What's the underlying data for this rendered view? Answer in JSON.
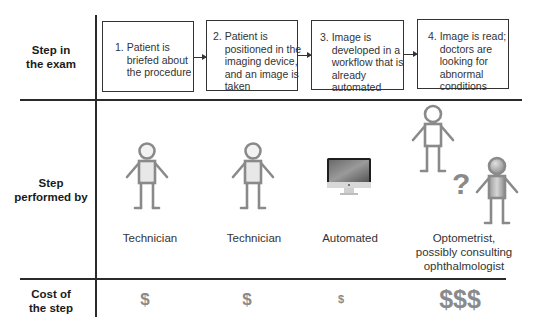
{
  "rows": {
    "step": "Step in\nthe exam",
    "performer": "Step\nperformed by",
    "cost": "Cost of\nthe step"
  },
  "steps": [
    {
      "text": "1. Patient is\n    briefed about\n    the procedure"
    },
    {
      "text": "2. Patient is\n    positioned in the\n    imaging device,\n    and an image is\n    taken"
    },
    {
      "text": "3. Image is\n    developed in a\n    workflow that is\n    already\n    automated"
    },
    {
      "text": "4. Image is read;\n    doctors are\n    looking for\n    abnormal\n    conditions"
    }
  ],
  "performers": [
    {
      "label": "Technician",
      "icon": "person-icon"
    },
    {
      "label": "Technician",
      "icon": "person-icon"
    },
    {
      "label": "Automated",
      "icon": "computer-icon"
    },
    {
      "label": "Optometrist,\npossibly consulting\nophthalmologist",
      "icon": "two-persons-question-icon",
      "question_mark": "?"
    }
  ],
  "costs": [
    "$",
    "$",
    "$",
    "$$$"
  ],
  "colors": {
    "line": "#2a2a2a",
    "figure_stroke": "#8a8a8a",
    "figure_fill": "#e6e6e6",
    "cost_text": "#8a8a8a"
  }
}
